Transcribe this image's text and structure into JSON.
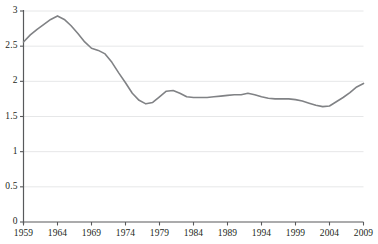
{
  "chart_data": {
    "type": "line",
    "title": "",
    "xlabel": "",
    "ylabel": "",
    "xlim": [
      1959,
      2009
    ],
    "ylim": [
      0,
      3
    ],
    "grid": true,
    "legend": null,
    "line_color": "#808285",
    "axis_color": "#58595b",
    "grid_color": "#e6e7e8",
    "x_tick_labels": [
      "1959",
      "1964",
      "1969",
      "1974",
      "1979",
      "1984",
      "1989",
      "1994",
      "1999",
      "2004",
      "2009"
    ],
    "y_tick_labels": [
      "0",
      "0.5",
      "1",
      "1.5",
      "2",
      "2.5",
      "3"
    ],
    "y_tick_values": [
      0,
      0.5,
      1,
      1.5,
      2,
      2.5,
      3
    ],
    "x_tick_values": [
      1959,
      1964,
      1969,
      1974,
      1979,
      1984,
      1989,
      1994,
      1999,
      2004,
      2009
    ],
    "series": [
      {
        "name": "Total fertility rate",
        "x": [
          1959,
          1960,
          1961,
          1962,
          1963,
          1964,
          1965,
          1966,
          1967,
          1968,
          1969,
          1970,
          1971,
          1972,
          1973,
          1974,
          1975,
          1976,
          1977,
          1978,
          1979,
          1980,
          1981,
          1982,
          1983,
          1984,
          1985,
          1986,
          1987,
          1988,
          1989,
          1990,
          1991,
          1992,
          1993,
          1994,
          1995,
          1996,
          1997,
          1998,
          1999,
          2000,
          2001,
          2002,
          2003,
          2004,
          2005,
          2006,
          2007,
          2008,
          2009
        ],
        "values": [
          2.56,
          2.66,
          2.74,
          2.81,
          2.88,
          2.93,
          2.88,
          2.79,
          2.68,
          2.56,
          2.47,
          2.44,
          2.39,
          2.27,
          2.12,
          1.98,
          1.83,
          1.73,
          1.68,
          1.7,
          1.78,
          1.86,
          1.87,
          1.83,
          1.78,
          1.77,
          1.77,
          1.77,
          1.78,
          1.79,
          1.8,
          1.81,
          1.81,
          1.83,
          1.81,
          1.78,
          1.76,
          1.75,
          1.75,
          1.75,
          1.74,
          1.72,
          1.69,
          1.66,
          1.64,
          1.65,
          1.71,
          1.77,
          1.84,
          1.92,
          1.97
        ]
      }
    ]
  },
  "axes": {
    "x_axis_name": "year-axis",
    "y_axis_name": "rate-axis"
  }
}
